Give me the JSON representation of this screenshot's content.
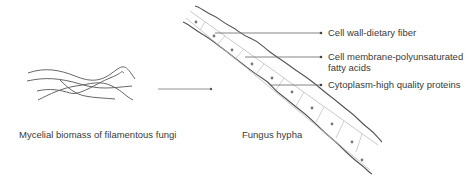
{
  "diagram": {
    "left_caption": "Mycelial biomass of filamentous fungi",
    "center_caption": "Fungus hypha",
    "annotations": [
      {
        "text": "Cell wall-dietary fiber"
      },
      {
        "text": "Cell membrane-polyunsaturated fatty acids"
      },
      {
        "text": "Cytoplasm-high quality proteins"
      }
    ],
    "colors": {
      "outline": "#555555",
      "inner": "#bbbbbb",
      "arrow": "#666666"
    }
  }
}
